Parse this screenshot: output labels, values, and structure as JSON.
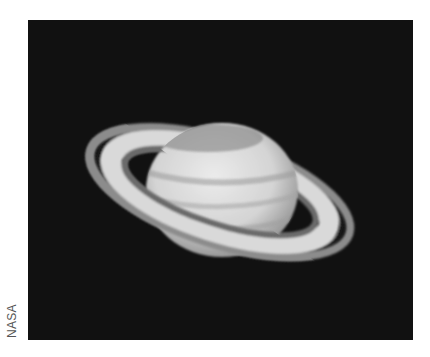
{
  "image": {
    "subject": "Saturn with rings",
    "background_color": "#111111"
  },
  "credit": {
    "text": "NASA"
  }
}
